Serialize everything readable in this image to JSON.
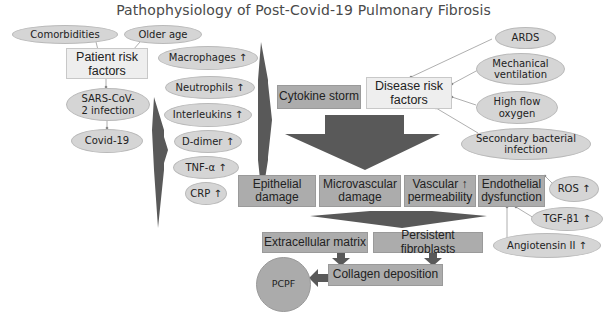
{
  "title": "Pathophysiology of Post-Covid-19 Pulmonary Fibrosis",
  "colors": {
    "ellipse_fill": "#d5d5d5",
    "light_box_fill": "#eeeeee",
    "mid_box_fill": "#acacac",
    "arrow_fill": "#595959",
    "connector_line": "#9a9a9a"
  },
  "patient_side": {
    "comorbidities": "Comorbidities",
    "older_age": "Older age",
    "patient_risk_factors": "Patient risk factors",
    "sars_cov2_infection": "SARS-CoV-2 infection",
    "covid19": "Covid-19"
  },
  "markers": [
    {
      "label": "Macrophages",
      "trend": "↑"
    },
    {
      "label": "Neutrophils",
      "trend": "↑"
    },
    {
      "label": "Interleukins",
      "trend": "↑"
    },
    {
      "label": "D-dimer",
      "trend": "↑"
    },
    {
      "label": "TNF-α",
      "trend": "↑"
    },
    {
      "label": "CRP",
      "trend": "↑"
    }
  ],
  "cytokine_storm": "Cytokine storm",
  "disease_side": {
    "disease_risk_factors": "Disease risk factors",
    "ards": "ARDS",
    "mechanical_ventilation": "Mechanical ventilation",
    "high_flow_oxygen": "High flow oxygen",
    "secondary_bacterial_infection": "Secondary bacterial infection"
  },
  "damage_row": {
    "epithelial_damage": "Epithelial damage",
    "microvascular_damage": "Microvascular damage",
    "vascular_permeability": "Vascular ↑ permeability",
    "endothelial_dysfunction": "Endothelial dysfunction"
  },
  "endothelial_factors": {
    "ros": "ROS ↑",
    "tgf_b1": "TGF-β1 ↑",
    "angiotensin_ii": "Angiotensin II ↑"
  },
  "fibrosis": {
    "extracellular_matrix": "Extracellular matrix",
    "persistent_fibroblasts": "Persistent fibroblasts",
    "collagen_deposition": "Collagen deposition",
    "pcpf": "PCPF"
  }
}
